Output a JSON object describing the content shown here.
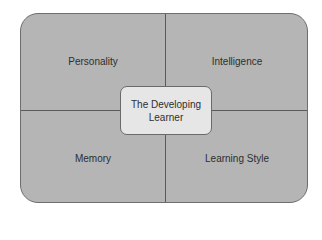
{
  "diagram": {
    "center": {
      "line1": "The Developing",
      "line2": "Learner"
    },
    "quadrants": {
      "top_left": "Personality",
      "top_right": "Intelligence",
      "bottom_left": "Memory",
      "bottom_right": "Learning Style"
    },
    "colors": {
      "quadrant_fill": "#b5b5b5",
      "center_fill": "#e6e6e6",
      "lines": "#5a5a5a"
    }
  }
}
